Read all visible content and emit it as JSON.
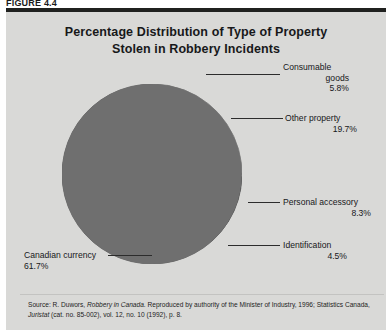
{
  "figure": {
    "label": "FIGURE 4.4"
  },
  "chart": {
    "title_line1": "Percentage Distribution of Type of Property",
    "title_line2": "Stolen in Robbery Incidents"
  },
  "source": {
    "prefix": "Source: R. Duwors, ",
    "italic1": "Robbery in Canada",
    "middle": ". Reproduced by authority of the Minister of Industry, 1996; Statistics Canada, ",
    "italic2": "Juristat",
    "suffix": " (cat. no. 85-002), vol. 12, no. 10 (1992), p. 8."
  },
  "labels": {
    "consumable_name1": "Consumable",
    "consumable_name2": "goods",
    "consumable_value": "5.8%",
    "other_name": "Other property",
    "other_value": "19.7%",
    "personal_name": "Personal accessory",
    "personal_value": "8.3%",
    "identification_name": "Identification",
    "identification_value": "4.5%",
    "currency_name": "Canadian currency",
    "currency_value": "61.7%"
  },
  "chart_data": {
    "type": "pie",
    "title": "Percentage Distribution of Type of Property Stolen in Robbery Incidents",
    "xlabel": "",
    "ylabel": "",
    "legend": "none",
    "grid": false,
    "units": "percent",
    "start_angle_deg": 0,
    "direction": "clockwise",
    "categories": [
      "Consumable goods",
      "Other property",
      "Personal accessory",
      "Identification",
      "Canadian currency"
    ],
    "values": [
      5.8,
      19.7,
      8.3,
      4.5,
      61.7
    ],
    "colors": [
      "#b4b4b2",
      "#fdfdfb",
      "#121212",
      "#3b3b3b",
      "#6f6f6f"
    ],
    "slices": [
      {
        "label": "Consumable goods",
        "value": 5.8,
        "color": "#b4b4b2",
        "start_deg": 0.0,
        "sweep_deg": 20.88
      },
      {
        "label": "Other property",
        "value": 19.7,
        "color": "#fdfdfb",
        "start_deg": 20.88,
        "sweep_deg": 70.92
      },
      {
        "label": "Personal accessory",
        "value": 8.3,
        "color": "#121212",
        "start_deg": 91.8,
        "sweep_deg": 29.88
      },
      {
        "label": "Identification",
        "value": 4.5,
        "color": "#3b3b3b",
        "start_deg": 121.68,
        "sweep_deg": 16.2
      },
      {
        "label": "Canadian currency",
        "value": 61.7,
        "color": "#6f6f6f",
        "start_deg": 137.88,
        "sweep_deg": 222.12
      }
    ],
    "total": 100.0
  }
}
